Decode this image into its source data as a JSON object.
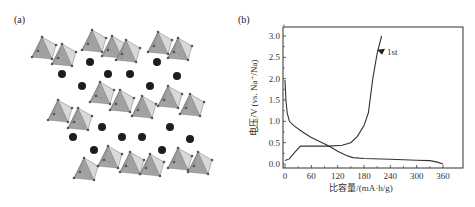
{
  "figure": {
    "panel_a": {
      "label": "(a)",
      "description": "Crystal structure: layers of gray corner-sharing octahedra with dark spherical ions between layers"
    },
    "panel_b": {
      "label": "(b)",
      "annotation": "1st"
    }
  },
  "chart_data": {
    "type": "line",
    "title": "",
    "xlabel": "比容量/(mA·h/g)",
    "ylabel": "电压/V (vs. Na⁺/Na)",
    "xlim": [
      -10,
      395
    ],
    "ylim": [
      -0.1,
      3.2
    ],
    "xticks": [
      "0",
      "60",
      "120",
      "180",
      "240",
      "300",
      "360"
    ],
    "yticks": [
      "0.0",
      "0.5",
      "1.0",
      "1.5",
      "2.0",
      "2.5",
      "3.0"
    ],
    "grid": false,
    "legend": null,
    "annotations": [
      {
        "text": "1st",
        "x": 228,
        "y": 2.63,
        "arrow": true
      }
    ],
    "series": [
      {
        "name": "discharge",
        "x": [
          0,
          2,
          5,
          10,
          20,
          40,
          60,
          80,
          100,
          120,
          140,
          155,
          180,
          240,
          300,
          330,
          345,
          360
        ],
        "y": [
          1.97,
          1.5,
          1.2,
          1.0,
          0.9,
          0.75,
          0.62,
          0.52,
          0.42,
          0.3,
          0.2,
          0.15,
          0.13,
          0.11,
          0.09,
          0.08,
          0.05,
          0.0
        ]
      },
      {
        "name": "charge",
        "x": [
          0,
          10,
          20,
          35,
          60,
          100,
          130,
          150,
          165,
          180,
          190,
          200,
          210,
          220
        ],
        "y": [
          0.08,
          0.12,
          0.25,
          0.42,
          0.42,
          0.42,
          0.44,
          0.5,
          0.65,
          0.9,
          1.2,
          2.0,
          2.6,
          3.0
        ]
      }
    ]
  }
}
